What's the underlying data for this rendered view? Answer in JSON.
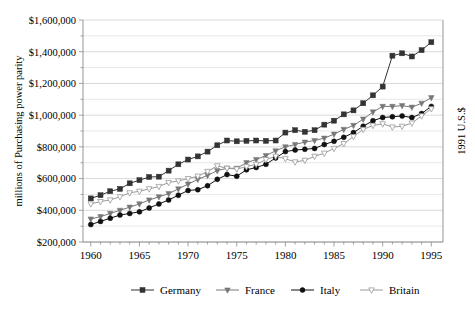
{
  "chart_data": {
    "type": "line",
    "title": "",
    "xlabel": "",
    "ylabel": "millions of Purchasing power parity",
    "ylabel_right": "1991 U.S.$",
    "xlim": [
      1959.2,
      1996.2
    ],
    "ylim": [
      200000,
      1600000
    ],
    "ytick_labels": [
      "$200,000",
      "$400,000",
      "$600,000",
      "$800,000",
      "$1,000,000",
      "$1,200,000",
      "$1,400,000",
      "$1,600,000"
    ],
    "ytick_values": [
      200000,
      400000,
      600000,
      800000,
      1000000,
      1200000,
      1400000,
      1600000
    ],
    "ytick_minor_values": [
      300000,
      500000,
      700000,
      900000,
      1100000,
      1300000,
      1500000
    ],
    "xtick_labels": [
      "1960",
      "1965",
      "1970",
      "1975",
      "1980",
      "1985",
      "1990",
      "1995"
    ],
    "xtick_values": [
      1960,
      1965,
      1970,
      1975,
      1980,
      1985,
      1990,
      1995
    ],
    "grid": "horizontal",
    "legend_position": "bottom",
    "x": [
      1960,
      1961,
      1962,
      1963,
      1964,
      1965,
      1966,
      1967,
      1968,
      1969,
      1970,
      1971,
      1972,
      1973,
      1974,
      1975,
      1976,
      1977,
      1978,
      1979,
      1980,
      1981,
      1982,
      1983,
      1984,
      1985,
      1986,
      1987,
      1988,
      1989,
      1990,
      1991,
      1992,
      1993,
      1994,
      1995
    ],
    "series": [
      {
        "name": "Germany",
        "marker": "filled-square",
        "color": "#333333",
        "values": [
          475000,
          495000,
          520000,
          535000,
          570000,
          590000,
          610000,
          612000,
          650000,
          690000,
          720000,
          740000,
          770000,
          810000,
          840000,
          835000,
          838000,
          840000,
          838000,
          840000,
          890000,
          905000,
          895000,
          905000,
          940000,
          965000,
          1005000,
          1030000,
          1075000,
          1125000,
          1180000,
          1375000,
          1390000,
          1370000,
          1410000,
          1460000
        ]
      },
      {
        "name": "France",
        "marker": "filled-triangle",
        "color": "#777777",
        "values": [
          345000,
          360000,
          380000,
          400000,
          420000,
          440000,
          465000,
          485000,
          505000,
          535000,
          565000,
          595000,
          620000,
          650000,
          665000,
          665000,
          700000,
          720000,
          745000,
          775000,
          800000,
          815000,
          830000,
          840000,
          855000,
          880000,
          910000,
          935000,
          975000,
          1020000,
          1055000,
          1055000,
          1060000,
          1050000,
          1075000,
          1110000
        ]
      },
      {
        "name": "Italy",
        "marker": "filled-circle",
        "color": "#111111",
        "values": [
          310000,
          330000,
          350000,
          370000,
          380000,
          390000,
          415000,
          440000,
          465000,
          495000,
          525000,
          530000,
          555000,
          595000,
          625000,
          615000,
          655000,
          670000,
          690000,
          730000,
          770000,
          780000,
          785000,
          790000,
          815000,
          835000,
          860000,
          890000,
          930000,
          965000,
          985000,
          990000,
          995000,
          985000,
          1010000,
          1055000
        ]
      },
      {
        "name": "Britain",
        "marker": "open-triangle",
        "color": "#9a9a9a",
        "values": [
          440000,
          455000,
          465000,
          485000,
          510000,
          520000,
          535000,
          550000,
          575000,
          585000,
          600000,
          615000,
          645000,
          680000,
          665000,
          660000,
          675000,
          690000,
          720000,
          740000,
          725000,
          705000,
          715000,
          740000,
          760000,
          790000,
          820000,
          865000,
          910000,
          935000,
          945000,
          925000,
          930000,
          950000,
          995000,
          1040000
        ]
      }
    ]
  },
  "legend": {
    "items": [
      {
        "label": "Germany"
      },
      {
        "label": "France"
      },
      {
        "label": "Italy"
      },
      {
        "label": "Britain"
      }
    ]
  }
}
